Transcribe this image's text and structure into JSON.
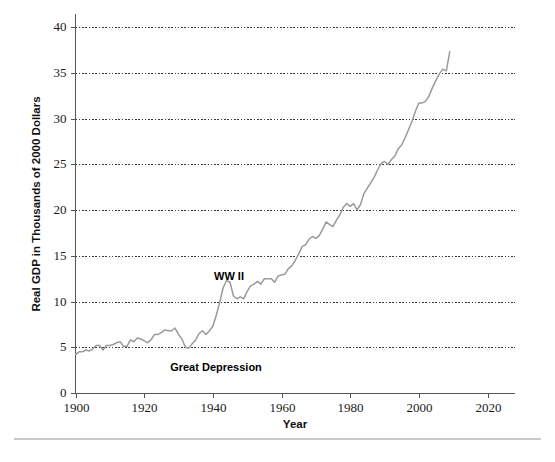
{
  "figure": {
    "background_color": "#ffffff",
    "line_color": "#9a9a9a",
    "grid_color": "#3a3a3a",
    "axis_color": "#555555",
    "footer_rule_color": "#c9c9c9"
  },
  "axis": {
    "ylabel": "Real GDP in Thousands of 2000 Dollars",
    "xlabel": "Year",
    "ytick_labels": [
      "0",
      "5",
      "10",
      "15",
      "20",
      "25",
      "30",
      "35",
      "40"
    ],
    "xtick_labels": [
      "1900",
      "1920",
      "1940",
      "1960",
      "1980",
      "2000",
      "2020"
    ]
  },
  "annotations": {
    "ww2": "WW II",
    "great_depression": "Great Depression"
  },
  "chart_data": {
    "type": "line",
    "title": "",
    "xlabel": "Year",
    "ylabel": "Real GDP in Thousands of 2000 Dollars",
    "xlim": [
      1900,
      2028
    ],
    "ylim": [
      0,
      40
    ],
    "xticks": [
      1900,
      1920,
      1940,
      1960,
      1980,
      2000,
      2020
    ],
    "yticks": [
      0,
      5,
      10,
      15,
      20,
      25,
      30,
      35,
      40
    ],
    "grid": "horizontal-dotted",
    "legend": "none",
    "annotations": [
      {
        "text": "WW II",
        "x": 1945,
        "y": 13.8
      },
      {
        "text": "Great Depression",
        "x": 1933,
        "y": 3.6
      }
    ],
    "series": [
      {
        "name": "Real GDP per capita (thousands of 2000 dollars)",
        "x": [
          1900,
          1901,
          1902,
          1903,
          1904,
          1905,
          1906,
          1907,
          1908,
          1909,
          1910,
          1911,
          1912,
          1913,
          1914,
          1915,
          1916,
          1917,
          1918,
          1919,
          1920,
          1921,
          1922,
          1923,
          1924,
          1925,
          1926,
          1927,
          1928,
          1929,
          1930,
          1931,
          1932,
          1933,
          1934,
          1935,
          1936,
          1937,
          1938,
          1939,
          1940,
          1941,
          1942,
          1943,
          1944,
          1945,
          1946,
          1947,
          1948,
          1949,
          1950,
          1951,
          1952,
          1953,
          1954,
          1955,
          1956,
          1957,
          1958,
          1959,
          1960,
          1961,
          1962,
          1963,
          1964,
          1965,
          1966,
          1967,
          1968,
          1969,
          1970,
          1971,
          1972,
          1973,
          1974,
          1975,
          1976,
          1977,
          1978,
          1979,
          1980,
          1981,
          1982,
          1983,
          1984,
          1985,
          1986,
          1987,
          1988,
          1989,
          1990,
          1991,
          1992,
          1993,
          1994,
          1995,
          1996,
          1997,
          1998,
          1999,
          2000,
          2001,
          2002,
          2003,
          2004,
          2005,
          2006,
          2007,
          2008,
          2009
        ],
        "values": [
          4.2,
          4.5,
          4.5,
          4.7,
          4.6,
          4.8,
          5.2,
          5.2,
          4.7,
          5.2,
          5.2,
          5.3,
          5.5,
          5.6,
          5.1,
          5.1,
          5.8,
          5.6,
          6.0,
          5.9,
          5.7,
          5.5,
          5.8,
          6.4,
          6.4,
          6.6,
          6.9,
          6.8,
          6.8,
          7.1,
          6.4,
          5.9,
          5.0,
          4.9,
          5.4,
          5.8,
          6.5,
          6.8,
          6.4,
          6.8,
          7.3,
          8.5,
          9.9,
          11.5,
          12.3,
          12.1,
          10.6,
          10.3,
          10.5,
          10.3,
          11.1,
          11.7,
          11.9,
          12.2,
          11.9,
          12.5,
          12.5,
          12.5,
          12.1,
          12.8,
          12.9,
          13.0,
          13.6,
          13.9,
          14.5,
          15.2,
          16.0,
          16.2,
          16.8,
          17.1,
          16.9,
          17.2,
          17.9,
          18.7,
          18.4,
          18.2,
          18.9,
          19.5,
          20.3,
          20.7,
          20.4,
          20.7,
          20.0,
          20.6,
          21.8,
          22.4,
          23.0,
          23.6,
          24.4,
          25.1,
          25.3,
          25.0,
          25.5,
          25.9,
          26.7,
          27.1,
          27.9,
          28.8,
          29.7,
          30.8,
          31.7,
          31.7,
          31.9,
          32.5,
          33.4,
          34.2,
          34.9,
          35.4,
          35.2,
          37.3
        ]
      }
    ]
  }
}
